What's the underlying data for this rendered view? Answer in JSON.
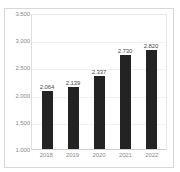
{
  "chart_data": {
    "type": "bar",
    "title": "",
    "xlabel": "",
    "ylabel": "",
    "categories": [
      "2018",
      "2019",
      "2020",
      "2021",
      "2022"
    ],
    "values": [
      2064,
      2139,
      2337,
      2730,
      2820
    ],
    "value_labels": [
      "2.064",
      "2.139",
      "2.337",
      "2.730",
      "2.820"
    ],
    "ylim": [
      1000,
      3500
    ],
    "ytick_values": [
      3500,
      3000,
      2500,
      2000,
      1500,
      1000
    ],
    "ytick_labels": [
      "3.500",
      "3.000",
      "2.500",
      "2.000",
      "1.500",
      "1.000"
    ],
    "grid": true,
    "legend": "none",
    "bar_color": "#232323",
    "label_color": "#4d4d4d",
    "tick_color": "#8a8a8a",
    "gridline_color": "#f2f2f2",
    "plot_border_color": "#dddddd",
    "card_border_color": "#d8d8d8",
    "background": "#ffffff"
  },
  "top_remnant": {
    "text": ""
  }
}
